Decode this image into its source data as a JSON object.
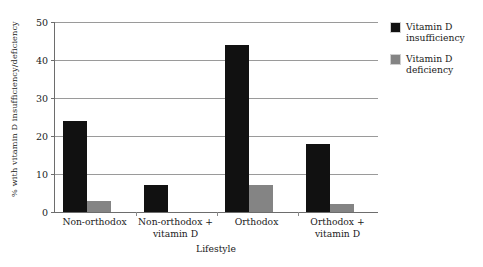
{
  "chart_data": {
    "type": "bar",
    "title": "",
    "xlabel": "Lifestyle",
    "ylabel": "% with vitamin D insufficiency/deficiency",
    "categories": [
      "Non-orthodox",
      "Non-orthodox +\nvitamin D",
      "Orthodox",
      "Orthodox +\nvitamin D"
    ],
    "series": [
      {
        "name": "Vitamin D\ninsufficiency",
        "color": "#111111",
        "values": [
          24,
          7,
          44,
          18
        ]
      },
      {
        "name": "Vitamin D\ndeficiency",
        "color": "#848484",
        "values": [
          3,
          0,
          7,
          2
        ]
      }
    ],
    "ylim": [
      0,
      50
    ],
    "yticks": [
      0,
      10,
      20,
      30,
      40,
      50
    ],
    "ytick_labels": [
      "0",
      "10",
      "20",
      "30",
      "40",
      "50"
    ],
    "grid": true,
    "legend_position": "right"
  },
  "legend": {
    "items": [
      {
        "label": "Vitamin D\ninsufficiency",
        "color": "#111111"
      },
      {
        "label": "Vitamin D\ndeficiency",
        "color": "#848484"
      }
    ]
  },
  "axes": {
    "x_title": "Lifestyle",
    "y_title": "% with vitamin D insufficiency/deficiency"
  }
}
